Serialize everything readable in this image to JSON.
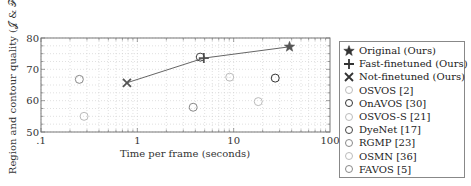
{
  "chart_data": {
    "type": "scatter",
    "title": "",
    "xlabel": "Time per frame (seconds)",
    "ylabel": "Region and contour quality (𝒥 & ℱ)",
    "xscale": "log",
    "xlim": [
      0.1,
      100
    ],
    "ylim": [
      50,
      80
    ],
    "xticks": [
      ".1",
      "1",
      "10",
      "100"
    ],
    "yticks": [
      "50",
      "60",
      "70",
      "80"
    ],
    "grid": true,
    "legend_position": "right",
    "series": [
      {
        "name": "Original (Ours)",
        "marker": "star",
        "color": "#555555",
        "points": [
          [
            38,
            77.2
          ]
        ]
      },
      {
        "name": "Fast-finetuned (Ours)",
        "marker": "plus",
        "color": "#555555",
        "points": [
          [
            4.9,
            73.6
          ]
        ]
      },
      {
        "name": "Not-finetuned (Ours)",
        "marker": "x",
        "color": "#555555",
        "points": [
          [
            0.78,
            65.7
          ]
        ]
      },
      {
        "name": "OSVOS [2]",
        "marker": "circle",
        "color": "#bbbbbb",
        "points": [
          [
            9.1,
            67.5
          ]
        ]
      },
      {
        "name": "OnAVOS [30]",
        "marker": "circle",
        "color": "#333333",
        "points": [
          [
            27,
            67.2
          ]
        ]
      },
      {
        "name": "OSVOS-S [21]",
        "marker": "circle",
        "color": "#bbbbbb",
        "points": [
          [
            18,
            59.7
          ]
        ]
      },
      {
        "name": "DyeNet [17]",
        "marker": "circle",
        "color": "#444444",
        "points": [
          [
            4.5,
            73.9
          ]
        ]
      },
      {
        "name": "RGMP [23]",
        "marker": "circle",
        "color": "#888888",
        "points": [
          [
            0.25,
            66.8
          ]
        ]
      },
      {
        "name": "OSMN [36]",
        "marker": "circle",
        "color": "#bbbbbb",
        "points": [
          [
            0.28,
            55.0
          ]
        ]
      },
      {
        "name": "FAVOS [5]",
        "marker": "circle",
        "color": "#888888",
        "points": [
          [
            3.8,
            57.9
          ]
        ]
      }
    ],
    "line_connecting": [
      "Not-finetuned (Ours)",
      "Fast-finetuned (Ours)",
      "Original (Ours)"
    ]
  },
  "legend": {
    "items": [
      "Original (Ours)",
      "Fast-finetuned (Ours)",
      "Not-finetuned (Ours)",
      "OSVOS [2]",
      "OnAVOS [30]",
      "OSVOS-S [21]",
      "DyeNet [17]",
      "RGMP [23]",
      "OSMN [36]",
      "FAVOS [5]"
    ]
  }
}
